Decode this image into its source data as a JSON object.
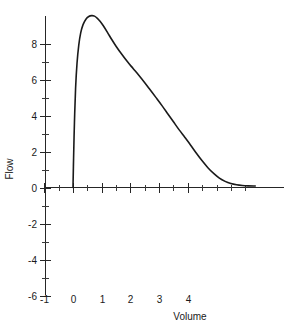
{
  "chart_data": {
    "type": "line",
    "title": "",
    "subtitle": "",
    "xlabel": "Volume",
    "ylabel": "Flow",
    "xlim": [
      -1,
      6.35
    ],
    "ylim": [
      -6,
      9.75
    ],
    "grid": false,
    "legend": null,
    "x_ticks": [
      -1,
      0,
      1,
      2,
      3,
      4
    ],
    "x_tick_labels": [
      "-1",
      "0",
      "1",
      "2",
      "3",
      "4"
    ],
    "x_minor_ticks": [
      -0.5,
      0.5,
      1.5,
      2.5,
      3.5,
      4.5,
      5,
      5.5,
      6
    ],
    "y_ticks": [
      -6,
      -4,
      -2,
      0,
      2,
      4,
      6,
      8
    ],
    "y_tick_labels": [
      "-6",
      "-4",
      "-2",
      "0",
      "2",
      "4",
      "6",
      "8"
    ],
    "y_minor_ticks": [
      -5,
      -3,
      -1,
      1,
      3,
      5,
      7
    ],
    "series": [
      {
        "name": "Flow-volume expiratory limb",
        "color": "#1a1a1a",
        "x": [
          0.0,
          0.02,
          0.05,
          0.09,
          0.14,
          0.2,
          0.27,
          0.35,
          0.45,
          0.55,
          0.65,
          0.75,
          0.85,
          0.95,
          1.05,
          1.2,
          1.35,
          1.5,
          1.7,
          1.9,
          2.1,
          2.3,
          2.5,
          2.7,
          2.9,
          3.1,
          3.3,
          3.5,
          3.7,
          3.9,
          4.1,
          4.3,
          4.5,
          4.7,
          4.9,
          5.1,
          5.3,
          5.5,
          5.7,
          5.9,
          6.1,
          6.35
        ],
        "y": [
          0.0,
          1.6,
          3.6,
          5.5,
          6.9,
          7.9,
          8.6,
          9.05,
          9.35,
          9.5,
          9.55,
          9.52,
          9.4,
          9.22,
          9.0,
          8.62,
          8.22,
          7.85,
          7.4,
          6.98,
          6.6,
          6.22,
          5.82,
          5.4,
          4.98,
          4.55,
          4.1,
          3.65,
          3.2,
          2.78,
          2.35,
          1.9,
          1.48,
          1.1,
          0.78,
          0.52,
          0.34,
          0.22,
          0.15,
          0.11,
          0.09,
          0.08
        ]
      }
    ],
    "annotations": []
  },
  "axes": {
    "x_title": "Volume",
    "y_title": "Flow"
  }
}
